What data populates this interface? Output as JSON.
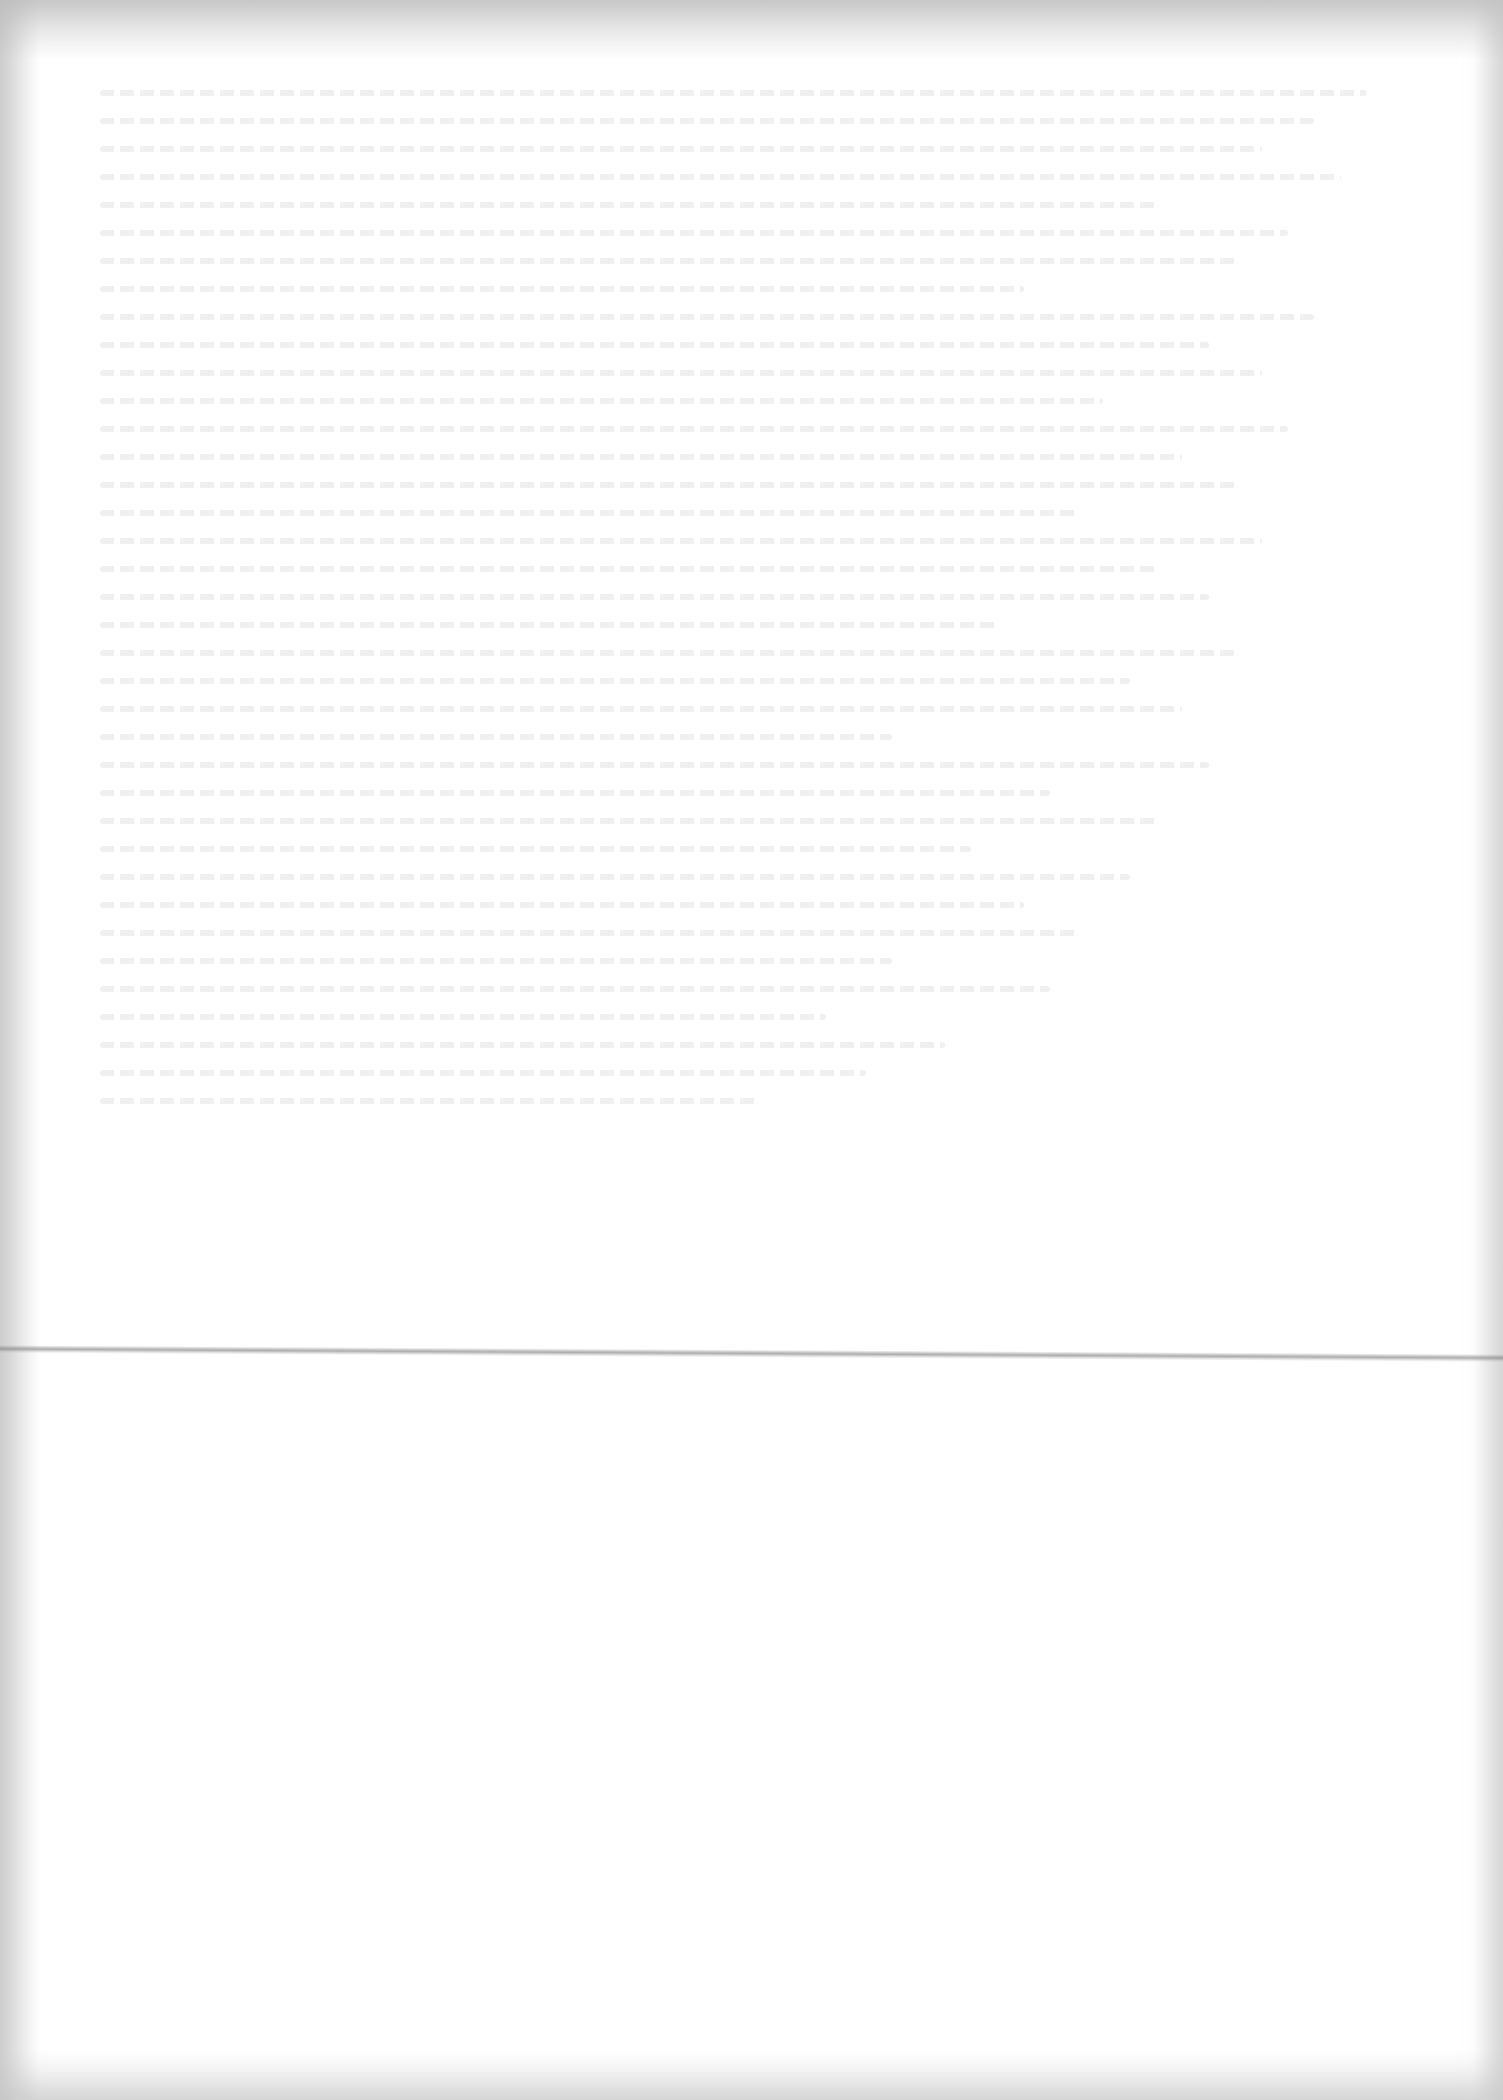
{
  "document": {
    "type": "scanned blank page",
    "legible_text": "",
    "visible_features": [
      "faint illegible bleed-through text in upper portion",
      "horizontal fold crease",
      "scanner edge shading"
    ],
    "colors": {
      "paper": "#ffffff",
      "edge_shading": "#b4b4b4",
      "fold": "#8c8c8c"
    }
  }
}
